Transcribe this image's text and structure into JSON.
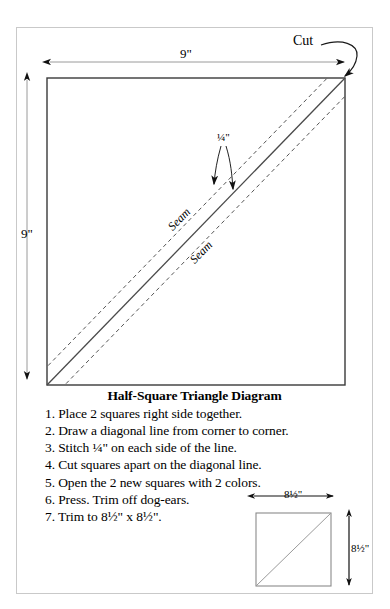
{
  "diagram": {
    "title": "Half-Square Triangle Diagram",
    "main_square": {
      "top_dimension": "9\"",
      "left_dimension": "9\"",
      "cut_label": "Cut",
      "seam_allowance_label": "¼\"",
      "seam_label_upper": "Seam",
      "seam_label_lower": "Seam"
    },
    "small_square": {
      "top_dimension": "8½\"",
      "right_dimension": "8½\""
    }
  },
  "steps": [
    "1. Place 2 squares right side together.",
    "2. Draw a diagonal line from corner to corner.",
    "3. Stitch ¼\" on each side of the line.",
    "4. Cut squares apart on the diagonal line.",
    "5. Open the 2 new squares with 2 colors.",
    "6. Press. Trim off dog-ears.",
    "7. Trim to 8½\" x 8½\"."
  ],
  "colors": {
    "ink": "#000000",
    "frame": "#c9c9c9",
    "square_outline": "#3a3a3a",
    "dash": "#555555",
    "dim_line": "#9a9a9a",
    "small_square_outline": "#8a8a8a",
    "background": "#ffffff"
  }
}
